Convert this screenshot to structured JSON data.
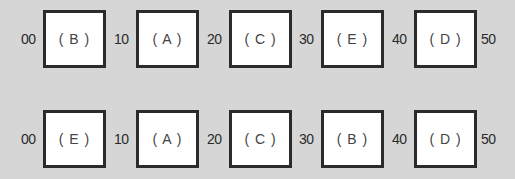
{
  "rows": [
    {
      "ticks": [
        "00",
        "10",
        "20",
        "30",
        "40",
        "50"
      ],
      "boxes": [
        "( B )",
        "( A )",
        "( C )",
        "( E )",
        "( D )"
      ]
    },
    {
      "ticks": [
        "00",
        "10",
        "20",
        "30",
        "40",
        "50"
      ],
      "boxes": [
        "( E )",
        "( A )",
        "( C )",
        "( B )",
        "( D )"
      ]
    }
  ],
  "colors": {
    "background": "#d6d6d6",
    "box_fill": "#ffffff",
    "box_border": "#2b2b2b",
    "text": "#2a2a2a"
  }
}
